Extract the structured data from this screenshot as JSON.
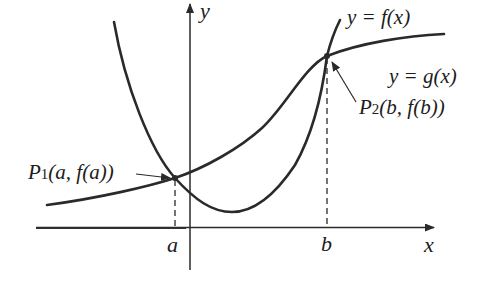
{
  "diagram": {
    "type": "function-intersection-graph",
    "axes": {
      "x_label": "x",
      "y_label": "y"
    },
    "curves": [
      {
        "name": "f",
        "label": "y = f(x)",
        "shape": "upward parabola"
      },
      {
        "name": "g",
        "label": "y = g(x)",
        "shape": "increasing curve"
      }
    ],
    "points": [
      {
        "name": "P1",
        "label_main": "P",
        "label_sub": "1",
        "label_args": "(a, f(a))",
        "x_tick": "a"
      },
      {
        "name": "P2",
        "label_main": "P",
        "label_sub": "2",
        "label_args": "(b, f(b))",
        "x_tick": "b"
      }
    ],
    "colors": {
      "stroke": "#2a2a2a",
      "background": "#ffffff"
    }
  }
}
